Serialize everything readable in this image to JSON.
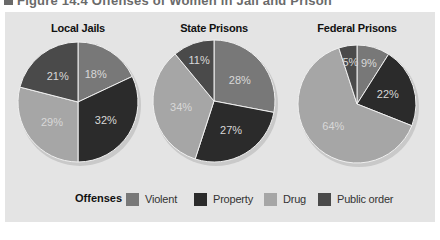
{
  "figure": {
    "title": "Figure 14.4  Offenses of Women in Jail and Prison"
  },
  "colors": {
    "Violent": "#787878",
    "Property": "#2b2b2b",
    "Drug": "#a6a6a6",
    "Public order": "#4a4a4a",
    "panel_bg": "#e4e4e4"
  },
  "legend": {
    "title": "Offenses",
    "items": [
      {
        "label": "Violent",
        "color": "#787878"
      },
      {
        "label": "Property",
        "color": "#2b2b2b"
      },
      {
        "label": "Drug",
        "color": "#a6a6a6"
      },
      {
        "label": "Public order",
        "color": "#4a4a4a"
      }
    ]
  },
  "chart_data": [
    {
      "type": "pie",
      "title": "Local Jails",
      "categories": [
        "Violent",
        "Property",
        "Drug",
        "Public order"
      ],
      "values": [
        18,
        32,
        29,
        21
      ],
      "labels": [
        "18%",
        "32%",
        "29%",
        "21%"
      ],
      "legend_position": "bottom"
    },
    {
      "type": "pie",
      "title": "State Prisons",
      "categories": [
        "Violent",
        "Property",
        "Drug",
        "Public order"
      ],
      "values": [
        28,
        27,
        34,
        11
      ],
      "labels": [
        "28%",
        "27%",
        "34%",
        "11%"
      ],
      "legend_position": "bottom"
    },
    {
      "type": "pie",
      "title": "Federal Prisons",
      "categories": [
        "Violent",
        "Property",
        "Drug",
        "Public order"
      ],
      "values": [
        9,
        22,
        64,
        5
      ],
      "labels": [
        "9%",
        "22%",
        "64%",
        "5%"
      ],
      "legend_position": "bottom"
    }
  ]
}
